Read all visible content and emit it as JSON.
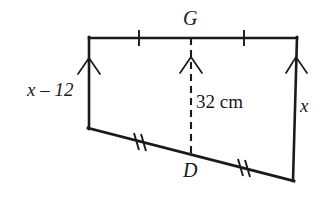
{
  "figure": {
    "type": "geometry-diagram",
    "shape": "trapezoid",
    "stroke_color": "#1a1a1a",
    "background_color": "#ffffff",
    "vertices": {
      "top_left": [
        89,
        38
      ],
      "top_right": [
        297,
        38
      ],
      "bottom_right": [
        293,
        180
      ],
      "bottom_left": [
        89,
        128
      ]
    },
    "labels": {
      "top_midpoint": "G",
      "bottom_midpoint": "D",
      "left_side": "x – 12",
      "right_side": "x",
      "height": "32 cm"
    },
    "height_segment": {
      "x": 191,
      "y_top": 38,
      "y_bottom": 154,
      "style": "dashed",
      "value": "32 cm"
    },
    "tick_marks": {
      "top_left_segment": 1,
      "top_right_segment": 1,
      "bottom_left_segment": 2,
      "bottom_right_segment": 2
    },
    "arrow_marks": [
      {
        "name": "left-side-arrow",
        "x": 89,
        "direction": "up"
      },
      {
        "name": "height-arrow",
        "x": 191,
        "direction": "up"
      },
      {
        "name": "right-side-arrow",
        "x": 297,
        "direction": "up"
      }
    ]
  }
}
